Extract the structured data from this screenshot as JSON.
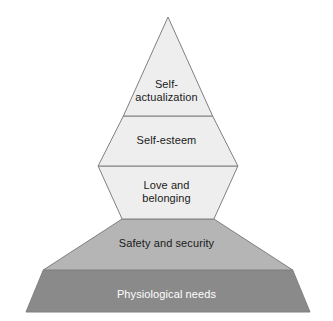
{
  "diagram": {
    "type": "pyramid",
    "background_color": "#ffffff",
    "outline_color": "#808080",
    "apex": {
      "x": 168,
      "y": 17
    },
    "base": {
      "left_x": 26,
      "right_x": 310,
      "y": 312
    },
    "tiers": [
      {
        "id": "tier-5",
        "level": 5,
        "position": "top",
        "label": "Self-\nactualization",
        "fill_color": "#eeeeee",
        "text_color": "#1a1a1a",
        "top_y": 17,
        "bottom_y": 116
      },
      {
        "id": "tier-4",
        "level": 4,
        "position": "upper-middle",
        "label": "Self-esteem",
        "fill_color": "#eeeeee",
        "text_color": "#1a1a1a",
        "top_y": 116,
        "bottom_y": 166
      },
      {
        "id": "tier-3",
        "level": 3,
        "position": "middle",
        "label": "Love and\nbelonging",
        "fill_color": "#eeeeee",
        "text_color": "#1a1a1a",
        "top_y": 166,
        "bottom_y": 219
      },
      {
        "id": "tier-2",
        "level": 2,
        "position": "lower-middle",
        "label": "Safety and security",
        "fill_color": "#b5b5b5",
        "text_color": "#1a1a1a",
        "top_y": 219,
        "bottom_y": 270
      },
      {
        "id": "tier-1",
        "level": 1,
        "position": "base",
        "label": "Physiological needs",
        "fill_color": "#8a8a8a",
        "text_color": "#ffffff",
        "top_y": 270,
        "bottom_y": 312
      }
    ]
  }
}
